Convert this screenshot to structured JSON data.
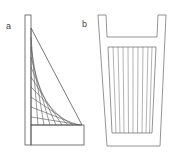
{
  "figure": {
    "panel_a": {
      "label": "a"
    },
    "panel_b": {
      "label": "b"
    },
    "colors": {
      "stroke": "#555555",
      "background": "#ffffff"
    }
  }
}
